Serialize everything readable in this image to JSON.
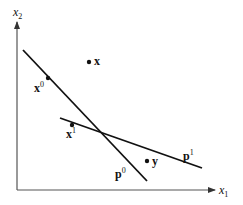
{
  "diagram": {
    "colors": {
      "axis": "#555555",
      "line": "#111111",
      "point": "#111111",
      "background": "#ffffff"
    },
    "axes": {
      "origin": [
        17,
        190
      ],
      "x_end": [
        215,
        190
      ],
      "y_end": [
        17,
        22
      ],
      "x_label": {
        "base": "x",
        "sub": "1"
      },
      "y_label": {
        "base": "x",
        "sub": "2"
      }
    },
    "lines": [
      {
        "name": "p0",
        "label": {
          "base": "p",
          "sup": "0"
        },
        "from": [
          23,
          50
        ],
        "to": [
          147,
          181
        ]
      },
      {
        "name": "p1",
        "label": {
          "base": "p",
          "sup": "1"
        },
        "from": [
          60,
          118
        ],
        "to": [
          202,
          168
        ]
      }
    ],
    "points": [
      {
        "name": "x",
        "label": {
          "base": "x",
          "sup": ""
        },
        "at": [
          89,
          62
        ]
      },
      {
        "name": "x0",
        "label": {
          "base": "x",
          "sup": "0"
        },
        "at": [
          48,
          78
        ]
      },
      {
        "name": "x1",
        "label": {
          "base": "x",
          "sup": "1"
        },
        "at": [
          72,
          125
        ]
      },
      {
        "name": "y",
        "label": {
          "base": "y",
          "sup": ""
        },
        "at": [
          147,
          161
        ]
      }
    ]
  }
}
